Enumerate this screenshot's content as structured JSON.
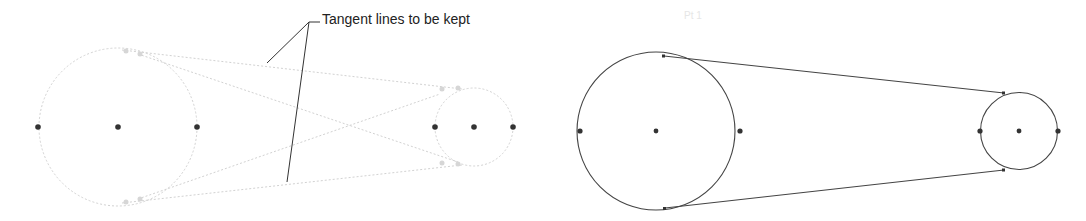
{
  "callout": {
    "label": "Tangent lines to be kept"
  },
  "faint_label": "Pt 1",
  "colors": {
    "background": "#ffffff",
    "faint_line": "#d0d0d0",
    "solid_line": "#444444",
    "point": "#333333",
    "text": "#222222"
  },
  "left_diagram": {
    "description": "Construction geometry with all candidate tangent lines (faint)",
    "large_circle": {
      "cx": 118,
      "cy": 127,
      "r": 79
    },
    "small_circle": {
      "cx": 474,
      "cy": 127,
      "r": 39
    },
    "points_x": [
      38,
      118,
      197,
      435,
      474,
      513
    ]
  },
  "right_diagram": {
    "description": "Result with outer tangent lines kept (belt/pulley profile)",
    "large_circle": {
      "cx": 656,
      "cy": 131,
      "r": 80
    },
    "small_circle": {
      "cx": 1019,
      "cy": 131,
      "r": 39
    },
    "points_x": [
      580,
      656,
      740,
      980,
      1019,
      1058
    ]
  }
}
